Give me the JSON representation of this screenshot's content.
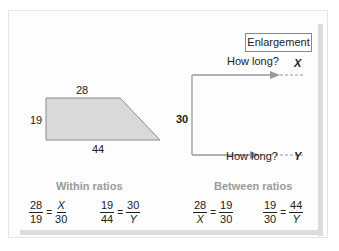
{
  "shape": {
    "top_label": "28",
    "left_label": "19",
    "bottom_label": "44",
    "fill": "#d9d9d9"
  },
  "enlargement": {
    "box_label": "Enlargement",
    "side_label": "30",
    "question_top": "How long?",
    "var_top": "X",
    "question_bottom": "How long?",
    "var_bottom": "Y",
    "arrow_color": "#999999"
  },
  "within": {
    "heading": "Within ratios",
    "ratio1": {
      "lhs_num": "28",
      "lhs_den": "19",
      "eq": "=",
      "rhs_num": "X",
      "rhs_den": "30"
    },
    "ratio2": {
      "lhs_num": "19",
      "lhs_den": "44",
      "eq": "=",
      "rhs_num": "30",
      "rhs_den": "Y"
    }
  },
  "between": {
    "heading": "Between ratios",
    "ratio1": {
      "lhs_num": "28",
      "lhs_den": "X",
      "eq": "=",
      "rhs_num": "19",
      "rhs_den": "30"
    },
    "ratio2": {
      "lhs_num": "19",
      "lhs_den": "30",
      "eq": "=",
      "rhs_num": "44",
      "rhs_den": "Y"
    }
  }
}
